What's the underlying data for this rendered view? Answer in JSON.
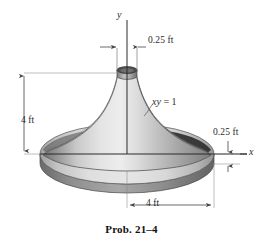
{
  "figure": {
    "caption": "Prob. 21–4",
    "axes": {
      "y_label": "y",
      "x_label": "x"
    },
    "curve_equation": {
      "variables": "xy",
      "relation": " = 1",
      "full": "xy = 1"
    },
    "dimensions": [
      {
        "name": "top-neck-width",
        "label": "0.25 ft"
      },
      {
        "name": "body-height",
        "label": "4 ft"
      },
      {
        "name": "base-thickness",
        "label": "0.25 ft"
      },
      {
        "name": "base-radius",
        "label": "4 ft"
      }
    ],
    "colors": {
      "background": "#ffffff",
      "line": "#2b2b2b",
      "dimension_line": "#555555",
      "body_light": "#e8e8e8",
      "body_mid": "#b8b8b8",
      "body_dark": "#6e6e6e",
      "shadow_dark": "#3a3a3a",
      "disc_top": "#d6d6d6",
      "disc_rim": "#8a8a8a"
    }
  }
}
